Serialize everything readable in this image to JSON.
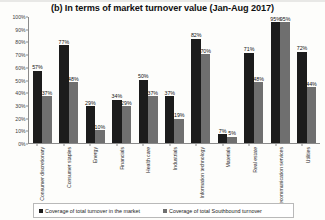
{
  "chart_data": {
    "type": "bar",
    "title": "(b) In terms of market turnover value (Jan-Aug 2017)",
    "xlabel": "",
    "ylabel": "",
    "ylim": [
      0,
      100
    ],
    "ytick_labels": [
      "100%",
      "90%",
      "80%",
      "70%",
      "60%",
      "50%",
      "40%",
      "30%",
      "20%",
      "10%",
      "0%"
    ],
    "ytick_values": [
      100,
      90,
      80,
      70,
      60,
      50,
      40,
      30,
      20,
      10,
      0
    ],
    "grid": false,
    "legend_position": "bottom",
    "categories": [
      "Consumer discretionary",
      "Consumer staples",
      "Energy",
      "Financials",
      "Health care",
      "Industrials",
      "Information technology",
      "Materials",
      "Real estate",
      "Telecommunication services",
      "Utilities"
    ],
    "series": [
      {
        "name": "Coverage of total turnover in the market",
        "color": "#1c1c1c",
        "values": [
          57,
          77,
          29,
          34,
          50,
          37,
          82,
          7,
          71,
          95,
          72
        ],
        "labels": [
          "57%",
          "77%",
          "29%",
          "34%",
          "50%",
          "37%",
          "82%",
          "7%",
          "71%",
          "95%",
          "72%"
        ]
      },
      {
        "name": "Coverage of total Southbound turnover",
        "color": "#6f6f6f",
        "values": [
          37,
          48,
          10,
          29,
          37,
          19,
          70,
          5,
          48,
          95,
          44
        ],
        "labels": [
          "37%",
          "48%",
          "10%",
          "29%",
          "37%",
          "19%",
          "70%",
          "5%",
          "48%",
          "95%",
          "44%"
        ]
      }
    ]
  }
}
